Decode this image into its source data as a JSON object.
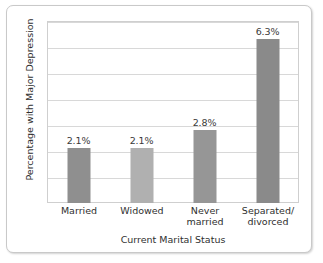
{
  "chart_data": {
    "type": "bar",
    "title": "",
    "xlabel": "Current Marital Status",
    "ylabel": "Percentage with Major Depression",
    "categories": [
      "Married",
      "Widowed",
      "Never married",
      "Separated/ divorced"
    ],
    "category_lines": [
      [
        "Married"
      ],
      [
        "Widowed"
      ],
      [
        "Never",
        "married"
      ],
      [
        "Separated/",
        "divorced"
      ]
    ],
    "values": [
      2.1,
      2.1,
      2.8,
      6.3
    ],
    "data_labels": [
      "2.1%",
      "2.1%",
      "2.8%",
      "6.3%"
    ],
    "ylim": [
      0,
      7
    ],
    "gridlines": [
      1,
      2,
      3,
      4,
      5,
      6,
      7
    ],
    "grid": true,
    "legend": "none",
    "tick_labels_y": [],
    "bar_colors": [
      "#8f8f8f",
      "#b0b0b0",
      "#969696",
      "#8a8a8a"
    ],
    "grid_color": "#d8d8d8",
    "plot_border_color": "#cfcfcf",
    "card_border_color": "#c9c9c9",
    "text_color": "#2f2f2f"
  }
}
